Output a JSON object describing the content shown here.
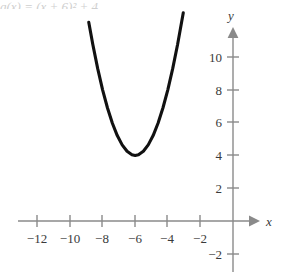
{
  "figure": {
    "caption_clipped": "g(x) = (x + 6)² + 4",
    "x_axis_name": "x",
    "y_axis_name": "y"
  },
  "chart_data": {
    "type": "line",
    "title": "",
    "subtitle": "",
    "xlabel": "x",
    "ylabel": "y",
    "xlim": [
      -13.2,
      1.7
    ],
    "ylim": [
      -3.4,
      11.9
    ],
    "grid": false,
    "legend": null,
    "x_ticks": [
      -12,
      -10,
      -8,
      -6,
      -4,
      -2
    ],
    "x_tick_labels": [
      "−12",
      "−10",
      "−8",
      "−6",
      "−4",
      "−2"
    ],
    "y_ticks": [
      10,
      8,
      6,
      4,
      2,
      -2
    ],
    "y_tick_labels": [
      "10",
      "8",
      "6",
      "4",
      "2",
      "−2"
    ],
    "series": [
      {
        "name": "g",
        "kind": "parabola",
        "vertex": [
          -6,
          4
        ],
        "leading_coefficient": 1,
        "x_domain": [
          -8.85,
          -3.0
        ],
        "points": [
          [
            -8.85,
            12.12
          ],
          [
            -8.6,
            10.76
          ],
          [
            -8.3,
            9.29
          ],
          [
            -8.0,
            8.0
          ],
          [
            -7.7,
            6.89
          ],
          [
            -7.4,
            5.96
          ],
          [
            -7.1,
            5.21
          ],
          [
            -6.8,
            4.64
          ],
          [
            -6.5,
            4.25
          ],
          [
            -6.2,
            4.04
          ],
          [
            -6.0,
            4.0
          ],
          [
            -5.8,
            4.04
          ],
          [
            -5.5,
            4.25
          ],
          [
            -5.2,
            4.64
          ],
          [
            -4.9,
            5.21
          ],
          [
            -4.6,
            5.96
          ],
          [
            -4.3,
            6.89
          ],
          [
            -4.0,
            8.0
          ],
          [
            -3.7,
            9.29
          ],
          [
            -3.4,
            10.76
          ],
          [
            -3.05,
            12.7
          ]
        ]
      }
    ]
  },
  "colors": {
    "axis": "#8a8a8a",
    "curve": "#111111",
    "text": "#3a3a3a",
    "background": "#ffffff"
  }
}
